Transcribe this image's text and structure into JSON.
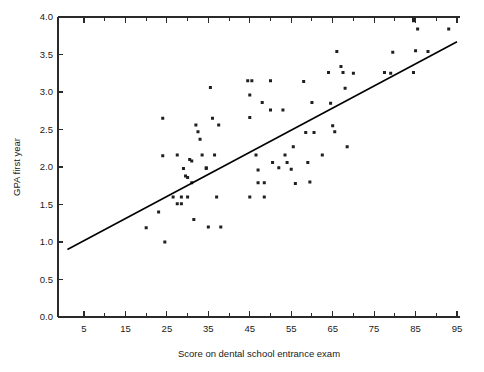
{
  "chart_data": {
    "type": "scatter",
    "title": "",
    "subtitle": "",
    "xlabel": "Score on dental school entrance exam",
    "ylabel": "GPA first year",
    "xlim": [
      1,
      95
    ],
    "ylim": [
      0.0,
      4.0
    ],
    "grid": false,
    "legend": null,
    "xticks_major": [
      5,
      15,
      25,
      35,
      45,
      55,
      65,
      75,
      85,
      95
    ],
    "xticks_minor": [
      10,
      20,
      30,
      40,
      50,
      60,
      70,
      80,
      90
    ],
    "xtick_labels": [
      "5",
      "15",
      "25",
      "35",
      "45",
      "55",
      "65",
      "75",
      "85",
      "95"
    ],
    "yticks": [
      0.0,
      0.5,
      1.0,
      1.5,
      2.0,
      2.5,
      3.0,
      3.5,
      4.0
    ],
    "ytick_labels": [
      "0.0",
      "0.5",
      "1.0",
      "1.5",
      "2.0",
      "2.5",
      "3.0",
      "3.5",
      "4.0"
    ],
    "axes_box": "top-and-bottom-ticks",
    "marker": "square-dot",
    "marker_color": "#1f1f1f",
    "marker_size_px": 3,
    "trendline": {
      "present": true,
      "color": "#000000",
      "x_start": 1,
      "y_start": 0.9,
      "x_end": 95,
      "y_end": 3.67,
      "slope": 0.0295,
      "intercept": 0.87
    },
    "points": [
      [
        20,
        1.19
      ],
      [
        24,
        2.65
      ],
      [
        24,
        2.15
      ],
      [
        23,
        1.4
      ],
      [
        24.5,
        1.0
      ],
      [
        26.5,
        1.6
      ],
      [
        27.5,
        2.16
      ],
      [
        27.5,
        1.51
      ],
      [
        28.5,
        1.51
      ],
      [
        28.5,
        1.6
      ],
      [
        29,
        1.98
      ],
      [
        29.5,
        1.88
      ],
      [
        30,
        1.86
      ],
      [
        30,
        1.6
      ],
      [
        30.5,
        2.1
      ],
      [
        31,
        2.08
      ],
      [
        31,
        1.79
      ],
      [
        31.5,
        1.3
      ],
      [
        32,
        2.56
      ],
      [
        32.5,
        2.47
      ],
      [
        33,
        2.37
      ],
      [
        33.5,
        2.16
      ],
      [
        34.5,
        1.99
      ],
      [
        34.5,
        1.98
      ],
      [
        35,
        1.2
      ],
      [
        35.5,
        3.06
      ],
      [
        36,
        2.65
      ],
      [
        36.5,
        2.16
      ],
      [
        37,
        1.6
      ],
      [
        37.5,
        2.56
      ],
      [
        38,
        1.2
      ],
      [
        44.5,
        3.15
      ],
      [
        45.5,
        3.15
      ],
      [
        45,
        2.96
      ],
      [
        45,
        2.66
      ],
      [
        45,
        1.6
      ],
      [
        46.5,
        2.16
      ],
      [
        47,
        1.96
      ],
      [
        47,
        1.79
      ],
      [
        48,
        2.86
      ],
      [
        48.5,
        1.6
      ],
      [
        48.5,
        1.79
      ],
      [
        50,
        3.15
      ],
      [
        50,
        2.76
      ],
      [
        50.5,
        2.06
      ],
      [
        52,
        1.99
      ],
      [
        53,
        2.76
      ],
      [
        53.5,
        2.16
      ],
      [
        54,
        2.06
      ],
      [
        55,
        1.97
      ],
      [
        55.5,
        2.27
      ],
      [
        56,
        1.78
      ],
      [
        58,
        3.14
      ],
      [
        58.5,
        2.46
      ],
      [
        59,
        2.06
      ],
      [
        59.5,
        1.8
      ],
      [
        60.5,
        2.46
      ],
      [
        60,
        2.86
      ],
      [
        62.5,
        2.16
      ],
      [
        64,
        3.26
      ],
      [
        64.5,
        2.85
      ],
      [
        65,
        2.55
      ],
      [
        65.5,
        2.47
      ],
      [
        66,
        3.54
      ],
      [
        67,
        3.34
      ],
      [
        67.5,
        3.26
      ],
      [
        68,
        3.05
      ],
      [
        68.5,
        2.27
      ],
      [
        70,
        3.25
      ],
      [
        77.5,
        3.26
      ],
      [
        79,
        3.25
      ],
      [
        79.5,
        3.53
      ],
      [
        84.5,
        3.26
      ],
      [
        84.5,
        3.95
      ],
      [
        84.5,
        3.97
      ],
      [
        85,
        3.55
      ],
      [
        85.5,
        3.84
      ],
      [
        88,
        3.54
      ],
      [
        93,
        3.84
      ]
    ]
  },
  "layout": {
    "plot_left_px": 58,
    "plot_right_px": 460,
    "plot_top_px": 17,
    "plot_bottom_px": 317
  }
}
